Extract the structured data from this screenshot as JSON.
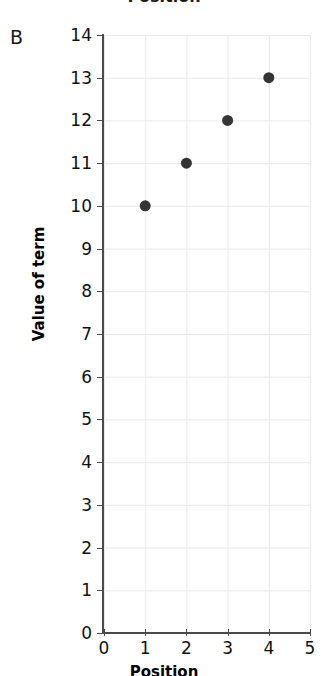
{
  "figure": {
    "panel_letter": "B",
    "clipped_top_title": "Position"
  },
  "chart_data": {
    "type": "scatter",
    "title": "",
    "xlabel": "Position",
    "ylabel": "Value of term",
    "xlim": [
      0,
      5
    ],
    "ylim": [
      0,
      14
    ],
    "xticks": [
      "0",
      "1",
      "2",
      "3",
      "4",
      "5"
    ],
    "yticks": [
      "0",
      "1",
      "2",
      "3",
      "4",
      "5",
      "6",
      "7",
      "8",
      "9",
      "10",
      "11",
      "12",
      "13",
      "14"
    ],
    "grid": true,
    "legend": "none",
    "x": [
      1,
      2,
      3,
      4
    ],
    "y": [
      10,
      11,
      12,
      13
    ],
    "points": [
      {
        "x": 1,
        "y": 10
      },
      {
        "x": 2,
        "y": 11
      },
      {
        "x": 3,
        "y": 12
      },
      {
        "x": 4,
        "y": 13
      }
    ],
    "marker": {
      "shape": "circle",
      "color": "#353535",
      "size_px": 11
    },
    "colors": {
      "grid": "#e9e9e9",
      "axis": "#4a4a4a",
      "text": "#111111",
      "background": "#ffffff"
    }
  }
}
